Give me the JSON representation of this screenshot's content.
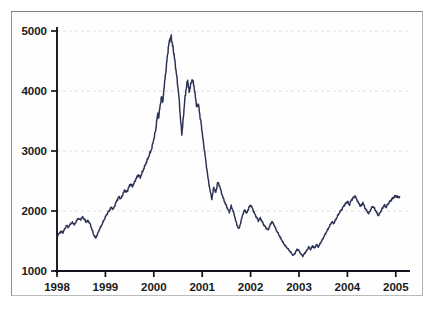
{
  "chart_data": {
    "type": "line",
    "title": "",
    "subtitle": "",
    "xlabel": "",
    "ylabel": "",
    "xlim": [
      1998.0,
      2005.25
    ],
    "ylim": [
      1000,
      5000
    ],
    "grid": true,
    "legend_position": "none",
    "line_color": "#2b3152",
    "axis_color": "#13131f",
    "grid_color": "#dcdce2",
    "background_color": "#ffffff",
    "x_ticks": [
      1998,
      1999,
      2000,
      2001,
      2002,
      2003,
      2004,
      2005
    ],
    "x_tick_labels": [
      "1998",
      "1999",
      "2000",
      "2001",
      "2002",
      "2003",
      "2004",
      "2005"
    ],
    "y_ticks": [
      1000,
      2000,
      3000,
      4000,
      5000
    ],
    "y_tick_labels": [
      "1000",
      "2000",
      "3000",
      "4000",
      "5000"
    ],
    "series": [
      {
        "name": "index",
        "x": [
          1998.0,
          1998.04,
          1998.08,
          1998.12,
          1998.16,
          1998.2,
          1998.24,
          1998.28,
          1998.32,
          1998.36,
          1998.4,
          1998.44,
          1998.48,
          1998.52,
          1998.56,
          1998.6,
          1998.64,
          1998.68,
          1998.72,
          1998.76,
          1998.8,
          1998.84,
          1998.88,
          1998.92,
          1998.96,
          1999.0,
          1999.04,
          1999.08,
          1999.12,
          1999.16,
          1999.2,
          1999.24,
          1999.28,
          1999.32,
          1999.36,
          1999.4,
          1999.44,
          1999.48,
          1999.52,
          1999.56,
          1999.6,
          1999.64,
          1999.68,
          1999.72,
          1999.76,
          1999.8,
          1999.84,
          1999.88,
          1999.92,
          1999.96,
          2000.0,
          2000.04,
          2000.06,
          2000.08,
          2000.1,
          2000.13,
          2000.16,
          2000.19,
          2000.21,
          2000.24,
          2000.27,
          2000.3,
          2000.33,
          2000.36,
          2000.39,
          2000.42,
          2000.45,
          2000.48,
          2000.52,
          2000.55,
          2000.58,
          2000.61,
          2000.64,
          2000.67,
          2000.7,
          2000.73,
          2000.76,
          2000.8,
          2000.83,
          2000.86,
          2000.89,
          2000.92,
          2000.95,
          2000.98,
          2001.0,
          2001.04,
          2001.08,
          2001.12,
          2001.16,
          2001.2,
          2001.24,
          2001.28,
          2001.32,
          2001.36,
          2001.4,
          2001.44,
          2001.48,
          2001.52,
          2001.56,
          2001.6,
          2001.64,
          2001.68,
          2001.72,
          2001.76,
          2001.8,
          2001.84,
          2001.88,
          2001.92,
          2001.96,
          2002.0,
          2002.04,
          2002.08,
          2002.12,
          2002.16,
          2002.2,
          2002.24,
          2002.28,
          2002.32,
          2002.36,
          2002.4,
          2002.44,
          2002.48,
          2002.52,
          2002.56,
          2002.6,
          2002.64,
          2002.68,
          2002.72,
          2002.76,
          2002.8,
          2002.84,
          2002.88,
          2002.92,
          2002.96,
          2003.0,
          2003.04,
          2003.08,
          2003.12,
          2003.16,
          2003.2,
          2003.24,
          2003.28,
          2003.32,
          2003.36,
          2003.4,
          2003.44,
          2003.48,
          2003.52,
          2003.56,
          2003.6,
          2003.64,
          2003.68,
          2003.72,
          2003.76,
          2003.8,
          2003.84,
          2003.88,
          2003.92,
          2003.96,
          2004.0,
          2004.04,
          2004.08,
          2004.12,
          2004.16,
          2004.2,
          2004.24,
          2004.28,
          2004.32,
          2004.36,
          2004.4,
          2004.44,
          2004.48,
          2004.52,
          2004.56,
          2004.6,
          2004.64,
          2004.68,
          2004.72,
          2004.76,
          2004.8,
          2004.84,
          2004.88,
          2004.92,
          2004.96,
          2005.0,
          2005.04,
          2005.08
        ],
        "y": [
          1580,
          1620,
          1660,
          1640,
          1700,
          1760,
          1730,
          1790,
          1810,
          1770,
          1830,
          1880,
          1850,
          1900,
          1870,
          1820,
          1840,
          1790,
          1700,
          1600,
          1550,
          1620,
          1700,
          1760,
          1830,
          1900,
          1960,
          2010,
          2060,
          2030,
          2100,
          2180,
          2240,
          2200,
          2280,
          2350,
          2310,
          2390,
          2450,
          2410,
          2480,
          2550,
          2600,
          2560,
          2640,
          2720,
          2800,
          2880,
          2960,
          3050,
          3200,
          3350,
          3500,
          3620,
          3560,
          3750,
          3900,
          3830,
          4050,
          4250,
          4500,
          4720,
          4860,
          4900,
          4750,
          4600,
          4400,
          4200,
          3900,
          3550,
          3280,
          3550,
          3850,
          4050,
          4180,
          3980,
          4100,
          4200,
          4080,
          3900,
          3720,
          3800,
          3600,
          3450,
          3300,
          3050,
          2800,
          2550,
          2350,
          2200,
          2400,
          2300,
          2480,
          2420,
          2300,
          2200,
          2120,
          2050,
          1980,
          2080,
          2000,
          1880,
          1760,
          1700,
          1820,
          1950,
          2020,
          1960,
          2050,
          2100,
          2040,
          1960,
          1900,
          1840,
          1880,
          1820,
          1760,
          1720,
          1680,
          1760,
          1820,
          1780,
          1700,
          1640,
          1580,
          1520,
          1460,
          1420,
          1380,
          1340,
          1300,
          1260,
          1300,
          1360,
          1340,
          1280,
          1250,
          1300,
          1340,
          1400,
          1360,
          1420,
          1380,
          1440,
          1400,
          1460,
          1520,
          1580,
          1640,
          1700,
          1760,
          1820,
          1790,
          1860,
          1920,
          1980,
          2020,
          2080,
          2120,
          2160,
          2100,
          2180,
          2220,
          2250,
          2180,
          2120,
          2080,
          2140,
          2060,
          2000,
          1960,
          2020,
          2080,
          2040,
          1980,
          1920,
          1980,
          2040,
          2100,
          2060,
          2120,
          2160,
          2200,
          2230,
          2250,
          2230,
          2240
        ]
      }
    ]
  }
}
